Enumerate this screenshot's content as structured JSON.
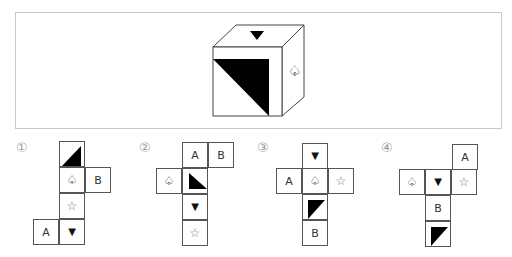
{
  "question": {
    "cube": {
      "top_face": "triangle-down",
      "front_face": "black-triangle-upper-right",
      "right_face": "spade-outline"
    }
  },
  "symbols": {
    "triangle_down": "▼",
    "spade": "♤",
    "star": "☆",
    "A": "A",
    "B": "B"
  },
  "options": [
    {
      "number": "①",
      "cells": [
        "black-triangle",
        "♤",
        "B",
        "☆",
        "A",
        "▼"
      ]
    },
    {
      "number": "②",
      "cells": [
        "A",
        "B",
        "♤",
        "black-triangle",
        "▼",
        "☆"
      ]
    },
    {
      "number": "③",
      "cells": [
        "▼",
        "A",
        "♤",
        "☆",
        "black-triangle",
        "B"
      ]
    },
    {
      "number": "④",
      "cells": [
        "A",
        "♤",
        "▼",
        "☆",
        "B",
        "black-triangle"
      ]
    }
  ]
}
